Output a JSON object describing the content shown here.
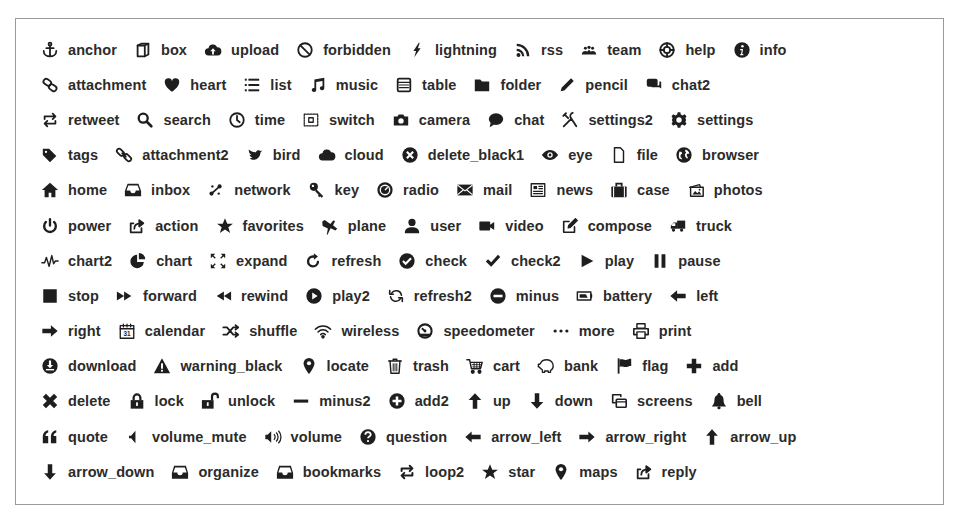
{
  "icon_grid": {
    "rows": [
      [
        {
          "name": "anchor",
          "icon": "anchor-icon"
        },
        {
          "name": "box",
          "icon": "box-icon"
        },
        {
          "name": "upload",
          "icon": "upload-icon"
        },
        {
          "name": "forbidden",
          "icon": "forbidden-icon"
        },
        {
          "name": "lightning",
          "icon": "lightning-icon"
        },
        {
          "name": "rss",
          "icon": "rss-icon"
        },
        {
          "name": "team",
          "icon": "team-icon"
        },
        {
          "name": "help",
          "icon": "help-icon"
        },
        {
          "name": "info",
          "icon": "info-icon"
        }
      ],
      [
        {
          "name": "attachment",
          "icon": "attachment-icon"
        },
        {
          "name": "heart",
          "icon": "heart-icon"
        },
        {
          "name": "list",
          "icon": "list-icon"
        },
        {
          "name": "music",
          "icon": "music-icon"
        },
        {
          "name": "table",
          "icon": "table-icon"
        },
        {
          "name": "folder",
          "icon": "folder-icon"
        },
        {
          "name": "pencil",
          "icon": "pencil-icon"
        },
        {
          "name": "chat2",
          "icon": "chat2-icon"
        }
      ],
      [
        {
          "name": "retweet",
          "icon": "retweet-icon"
        },
        {
          "name": "search",
          "icon": "search-icon"
        },
        {
          "name": "time",
          "icon": "time-icon"
        },
        {
          "name": "switch",
          "icon": "switch-icon"
        },
        {
          "name": "camera",
          "icon": "camera-icon"
        },
        {
          "name": "chat",
          "icon": "chat-icon"
        },
        {
          "name": "settings2",
          "icon": "settings2-icon"
        },
        {
          "name": "settings",
          "icon": "settings-icon"
        }
      ],
      [
        {
          "name": "tags",
          "icon": "tags-icon"
        },
        {
          "name": "attachment2",
          "icon": "attachment2-icon"
        },
        {
          "name": "bird",
          "icon": "bird-icon"
        },
        {
          "name": "cloud",
          "icon": "cloud-icon"
        },
        {
          "name": "delete_black1",
          "icon": "delete-black1-icon"
        },
        {
          "name": "eye",
          "icon": "eye-icon"
        },
        {
          "name": "file",
          "icon": "file-icon"
        },
        {
          "name": "browser",
          "icon": "browser-icon"
        }
      ],
      [
        {
          "name": "home",
          "icon": "home-icon"
        },
        {
          "name": "inbox",
          "icon": "inbox-icon"
        },
        {
          "name": "network",
          "icon": "network-icon"
        },
        {
          "name": "key",
          "icon": "key-icon"
        },
        {
          "name": "radio",
          "icon": "radio-icon"
        },
        {
          "name": "mail",
          "icon": "mail-icon"
        },
        {
          "name": "news",
          "icon": "news-icon"
        },
        {
          "name": "case",
          "icon": "case-icon"
        },
        {
          "name": "photos",
          "icon": "photos-icon"
        }
      ],
      [
        {
          "name": "power",
          "icon": "power-icon"
        },
        {
          "name": "action",
          "icon": "action-icon"
        },
        {
          "name": "favorites",
          "icon": "favorites-icon"
        },
        {
          "name": "plane",
          "icon": "plane-icon"
        },
        {
          "name": "user",
          "icon": "user-icon"
        },
        {
          "name": "video",
          "icon": "video-icon"
        },
        {
          "name": "compose",
          "icon": "compose-icon"
        },
        {
          "name": "truck",
          "icon": "truck-icon"
        }
      ],
      [
        {
          "name": "chart2",
          "icon": "chart2-icon"
        },
        {
          "name": "chart",
          "icon": "chart-icon"
        },
        {
          "name": "expand",
          "icon": "expand-icon"
        },
        {
          "name": "refresh",
          "icon": "refresh-icon"
        },
        {
          "name": "check",
          "icon": "check-icon"
        },
        {
          "name": "check2",
          "icon": "check2-icon"
        },
        {
          "name": "play",
          "icon": "play-icon"
        },
        {
          "name": "pause",
          "icon": "pause-icon"
        }
      ],
      [
        {
          "name": "stop",
          "icon": "stop-icon"
        },
        {
          "name": "forward",
          "icon": "forward-icon"
        },
        {
          "name": "rewind",
          "icon": "rewind-icon"
        },
        {
          "name": "play2",
          "icon": "play2-icon"
        },
        {
          "name": "refresh2",
          "icon": "refresh2-icon"
        },
        {
          "name": "minus",
          "icon": "minus-icon"
        },
        {
          "name": "battery",
          "icon": "battery-icon"
        },
        {
          "name": "left",
          "icon": "left-icon"
        }
      ],
      [
        {
          "name": "right",
          "icon": "right-icon"
        },
        {
          "name": "calendar",
          "icon": "calendar-icon"
        },
        {
          "name": "shuffle",
          "icon": "shuffle-icon"
        },
        {
          "name": "wireless",
          "icon": "wireless-icon"
        },
        {
          "name": "speedometer",
          "icon": "speedometer-icon"
        },
        {
          "name": "more",
          "icon": "more-icon"
        },
        {
          "name": "print",
          "icon": "print-icon"
        }
      ],
      [
        {
          "name": "download",
          "icon": "download-icon"
        },
        {
          "name": "warning_black",
          "icon": "warning-black-icon"
        },
        {
          "name": "locate",
          "icon": "locate-icon"
        },
        {
          "name": "trash",
          "icon": "trash-icon"
        },
        {
          "name": "cart",
          "icon": "cart-icon"
        },
        {
          "name": "bank",
          "icon": "bank-icon"
        },
        {
          "name": "flag",
          "icon": "flag-icon"
        },
        {
          "name": "add",
          "icon": "add-icon"
        }
      ],
      [
        {
          "name": "delete",
          "icon": "delete-icon"
        },
        {
          "name": "lock",
          "icon": "lock-icon"
        },
        {
          "name": "unlock",
          "icon": "unlock-icon"
        },
        {
          "name": "minus2",
          "icon": "minus2-icon"
        },
        {
          "name": "add2",
          "icon": "add2-icon"
        },
        {
          "name": "up",
          "icon": "up-icon"
        },
        {
          "name": "down",
          "icon": "down-icon"
        },
        {
          "name": "screens",
          "icon": "screens-icon"
        },
        {
          "name": "bell",
          "icon": "bell-icon"
        }
      ],
      [
        {
          "name": "quote",
          "icon": "quote-icon"
        },
        {
          "name": "volume_mute",
          "icon": "volume-mute-icon"
        },
        {
          "name": "volume",
          "icon": "volume-icon"
        },
        {
          "name": "question",
          "icon": "question-icon"
        },
        {
          "name": "arrow_left",
          "icon": "arrow-left-icon"
        },
        {
          "name": "arrow_right",
          "icon": "arrow-right-icon"
        },
        {
          "name": "arrow_up",
          "icon": "arrow-up-icon"
        }
      ],
      [
        {
          "name": "arrow_down",
          "icon": "arrow-down-icon"
        },
        {
          "name": "organize",
          "icon": "organize-icon"
        },
        {
          "name": "bookmarks",
          "icon": "bookmarks-icon"
        },
        {
          "name": "loop2",
          "icon": "loop2-icon"
        },
        {
          "name": "star",
          "icon": "star-icon"
        },
        {
          "name": "maps",
          "icon": "maps-icon"
        },
        {
          "name": "reply",
          "icon": "reply-icon"
        }
      ]
    ]
  },
  "colors": {
    "icon": "#1e1e1e",
    "label": "#2b2b2b",
    "border": "#9a9a9a",
    "background": "#ffffff"
  }
}
